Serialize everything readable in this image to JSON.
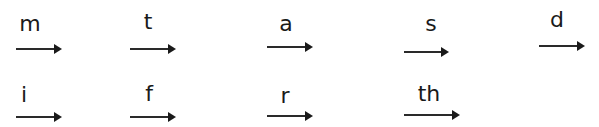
{
  "worksheet": {
    "rows": [
      {
        "items": [
          {
            "sound": "m",
            "lx": 16,
            "ly": 13,
            "lw": 28,
            "ax": 16,
            "ay": 48,
            "aw": 44
          },
          {
            "sound": "t",
            "lx": 136,
            "ly": 11,
            "lw": 24,
            "ax": 130,
            "ay": 48,
            "aw": 44
          },
          {
            "sound": "a",
            "lx": 274,
            "ly": 13,
            "lw": 24,
            "ax": 267,
            "ay": 46,
            "aw": 44
          },
          {
            "sound": "s",
            "lx": 419,
            "ly": 13,
            "lw": 24,
            "ax": 404,
            "ay": 51,
            "aw": 43
          },
          {
            "sound": "d",
            "lx": 545,
            "ly": 9,
            "lw": 24,
            "ax": 539,
            "ay": 45,
            "aw": 44
          }
        ]
      },
      {
        "items": [
          {
            "sound": "i",
            "lx": 12,
            "ly": 84,
            "lw": 24,
            "ax": 16,
            "ay": 116,
            "aw": 44
          },
          {
            "sound": "f",
            "lx": 137,
            "ly": 83,
            "lw": 24,
            "ax": 130,
            "ay": 116,
            "aw": 44
          },
          {
            "sound": "r",
            "lx": 273,
            "ly": 85,
            "lw": 24,
            "ax": 267,
            "ay": 115,
            "aw": 44
          },
          {
            "sound": "th",
            "lx": 414,
            "ly": 83,
            "lw": 30,
            "ax": 404,
            "ay": 114,
            "aw": 54
          }
        ]
      }
    ]
  }
}
